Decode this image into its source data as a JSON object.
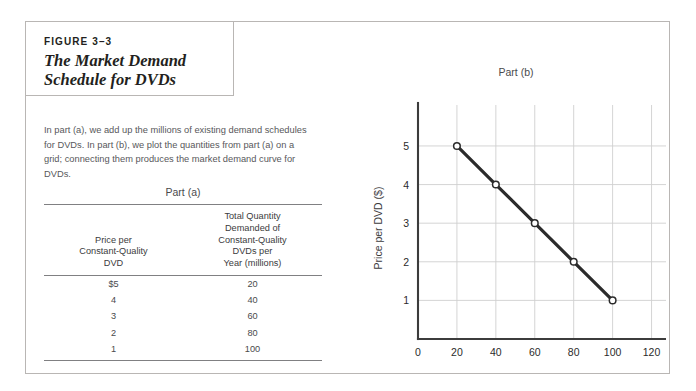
{
  "figure": {
    "number_label": "FIGURE 3–3",
    "title": "The Market Demand Schedule for DVDs",
    "caption": "In part (a), we add up the millions of existing demand schedules for DVDs. In part (b), we plot the quantities from part (a) on a grid; connecting them produces the market demand curve for DVDs."
  },
  "part_a": {
    "title": "Part (a)",
    "columns": [
      "Price per Constant-Quality DVD",
      "Total Quantity Demanded of Constant-Quality DVDs per Year (millions)"
    ],
    "column_lines": [
      [
        "Price per",
        "Constant-Quality",
        "DVD"
      ],
      [
        "Total Quantity",
        "Demanded of",
        "Constant-Quality",
        "DVDs per",
        "Year (millions)"
      ]
    ],
    "rows": [
      {
        "price": "$5",
        "quantity": "20"
      },
      {
        "price": "4",
        "quantity": "40"
      },
      {
        "price": "3",
        "quantity": "60"
      },
      {
        "price": "2",
        "quantity": "80"
      },
      {
        "price": "1",
        "quantity": "100"
      }
    ]
  },
  "part_b": {
    "title": "Part (b)"
  },
  "chart_data": {
    "type": "line",
    "title": "Part (b)",
    "xlabel": "Quantity of DVDs",
    "xlabel_sub": "(millions of constant-quality units per year)",
    "ylabel": "Price per DVD ($)",
    "x": [
      20,
      40,
      60,
      80,
      100
    ],
    "values": [
      5,
      4,
      3,
      2,
      1
    ],
    "series": [
      {
        "name": "Market demand for DVDs",
        "values": [
          5,
          4,
          3,
          2,
          1
        ]
      }
    ],
    "xlim": [
      0,
      130
    ],
    "ylim": [
      0,
      5.75
    ],
    "xticks": [
      0,
      20,
      40,
      60,
      80,
      100,
      120
    ],
    "xtick_labels": [
      "0",
      "20",
      "40",
      "60",
      "80",
      "100",
      "120"
    ],
    "yticks": [
      1,
      2,
      3,
      4,
      5
    ],
    "ytick_labels": [
      "1",
      "2",
      "3",
      "4",
      "5"
    ],
    "grid": true,
    "legend": "none",
    "marker": "open-circle",
    "line_color": "#2b2b2b",
    "grid_color": "#cfcfcf",
    "axis_color": "#3c3c3c"
  },
  "colors": {
    "frame_border": "#b9b6b4",
    "rule": "#808082",
    "text": "#231f20",
    "muted_text": "#58585b"
  }
}
